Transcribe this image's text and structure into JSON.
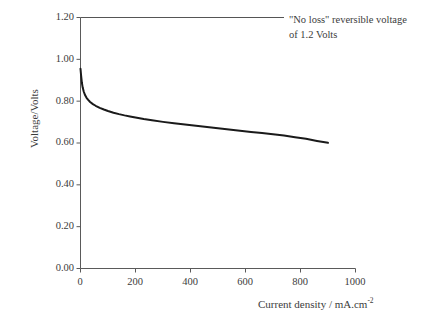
{
  "chart_data": {
    "type": "line",
    "title": "",
    "xlabel": "Current density / mA.cm",
    "xlabel_sup": "-2",
    "ylabel": "Voltage/Volts",
    "xlim": [
      0,
      1000
    ],
    "ylim": [
      0.0,
      1.2
    ],
    "xticks": [
      0,
      200,
      400,
      600,
      800,
      1000
    ],
    "xtick_labels": [
      "0",
      "200",
      "400",
      "600",
      "800",
      "1000"
    ],
    "yticks": [
      0.0,
      0.2,
      0.4,
      0.6,
      0.8,
      1.0,
      1.2
    ],
    "ytick_labels": [
      "0.00",
      "0.20",
      "0.40",
      "0.60",
      "0.80",
      "1.00",
      "1.20"
    ],
    "grid": false,
    "legend": null,
    "annotations": [
      {
        "name": "no-loss-reversible-voltage",
        "line1": "\"No loss\" reversible voltage",
        "line2": "of 1.2 Volts",
        "value": 1.2
      }
    ],
    "reference_line": {
      "name": "reversible-voltage-line",
      "y": 1.2,
      "x_start": 0,
      "x_end": 740,
      "color": "#555555"
    },
    "series": [
      {
        "name": "polarisation-curve",
        "color": "#1a1a1a",
        "x": [
          0,
          2,
          5,
          8,
          12,
          17,
          22,
          28,
          35,
          45,
          55,
          70,
          85,
          100,
          120,
          140,
          160,
          180,
          200,
          230,
          260,
          300,
          340,
          380,
          420,
          460,
          500,
          540,
          580,
          620,
          660,
          700,
          740,
          780,
          820,
          860,
          900
        ],
        "y": [
          0.955,
          0.925,
          0.888,
          0.865,
          0.845,
          0.828,
          0.816,
          0.806,
          0.796,
          0.786,
          0.778,
          0.768,
          0.76,
          0.753,
          0.745,
          0.738,
          0.732,
          0.727,
          0.722,
          0.715,
          0.709,
          0.701,
          0.694,
          0.688,
          0.682,
          0.676,
          0.67,
          0.664,
          0.659,
          0.653,
          0.648,
          0.642,
          0.636,
          0.628,
          0.62,
          0.61,
          0.601
        ]
      }
    ],
    "axis_color": "#5a5a5a",
    "background": "#ffffff"
  },
  "figure": {
    "name": "polarisation-curve-figure"
  }
}
